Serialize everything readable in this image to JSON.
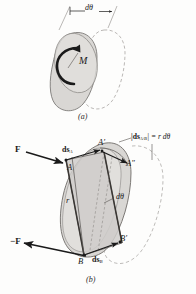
{
  "figure": {
    "title_semantic": "virtual-work-of-couple-and-force-pair",
    "panels": [
      {
        "id": "a",
        "caption": "(a)",
        "labels": {
          "moment": "M",
          "angle": "dθ"
        }
      },
      {
        "id": "b",
        "caption": "(b)",
        "labels": {
          "force_positive": "F",
          "force_negative": "−F",
          "point_a": "A",
          "point_a_prime": "A′",
          "point_a_double_prime": "A″",
          "point_b": "B",
          "point_b_prime": "B′",
          "ds_a": "ds",
          "ds_a_sub": "A",
          "ds_b": "ds",
          "ds_b_sub": "B",
          "radius": "r",
          "angle": "dθ",
          "relative_displacement": "|ds",
          "relative_displacement_sub": "A/B",
          "relative_displacement_tail": "| = r dθ"
        }
      }
    ],
    "colors": {
      "body_fill": "#d9d7d4",
      "body_fill_light": "#e4e2df",
      "outline": "#6f6c69",
      "dashed_outline": "#9a9794",
      "ink": "#1a1a1a",
      "paper": "#fdfdfc"
    }
  }
}
